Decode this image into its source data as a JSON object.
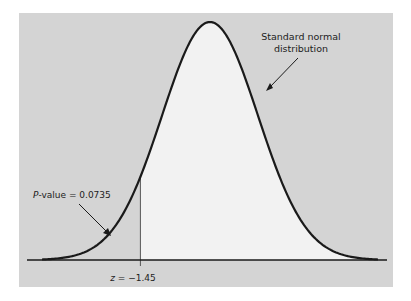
{
  "chart_data": {
    "type": "area",
    "title": "",
    "distribution": "standard normal",
    "mean": 0,
    "sd": 1,
    "x_range": [
      -3.5,
      3.5
    ],
    "test_statistic": {
      "label": "z = −1.45",
      "z": -1.45
    },
    "shaded_region": {
      "description": "left tail below z = -1.45 (gray)",
      "area": 0.0735
    },
    "unshaded_region": {
      "description": "area above z = -1.45 (light)",
      "area": 0.9265
    },
    "annotations": [
      {
        "text": "Standard normal distribution",
        "lines": [
          "Standard normal",
          "distribution"
        ],
        "points_to": "curve (right side)"
      },
      {
        "text": "P-value = 0.0735",
        "points_to": "left tail area"
      },
      {
        "text": "z = −1.45",
        "position": "below axis at tick"
      }
    ],
    "xlabel": "",
    "ylabel": "",
    "grid": false,
    "legend": null
  },
  "labels": {
    "curve_label_line1": "Standard normal",
    "curve_label_line2": "distribution",
    "pvalue_italic": "P",
    "pvalue_rest": "-value = 0.0735",
    "z_italic": "z",
    "z_rest": " = −1.45"
  },
  "colors": {
    "panel_bg": "#d4d4d4",
    "unshaded_fill": "#f2f2f2",
    "curve": "#1a1a1a",
    "axis": "#1a1a1a"
  }
}
